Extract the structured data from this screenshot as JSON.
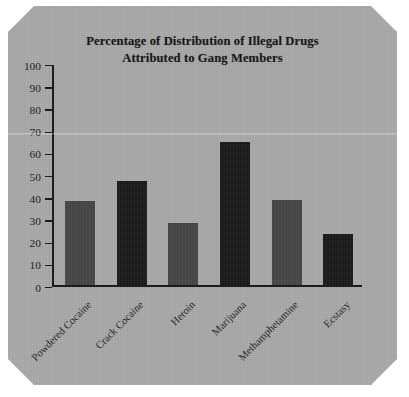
{
  "figure": {
    "background_color": "#a9a9a9",
    "title_color": "#131313"
  },
  "chart_data": {
    "type": "bar",
    "title": "Percentage of Distribution of Illegal Drugs Attributed to Gang Members",
    "title_lines": [
      "Percentage of Distribution of Illegal Drugs",
      "Attributed to Gang Members"
    ],
    "xlabel": "",
    "ylabel": "",
    "ylim": [
      0,
      100
    ],
    "ytick_step": 10,
    "yticks": [
      100,
      90,
      80,
      70,
      60,
      50,
      40,
      30,
      20,
      10,
      0
    ],
    "ytick_labels": [
      "100",
      "90",
      "80",
      "70",
      "60",
      "50",
      "40",
      "30",
      "20",
      "10",
      "0"
    ],
    "grid": false,
    "legend": false,
    "xtick_rotation": -45,
    "categories": [
      "Powdered Cocaine",
      "Crack Cocaine",
      "Heroin",
      "Marijuana",
      "Methamphetamine",
      "Ecstasy"
    ],
    "values": [
      38,
      47,
      28,
      64.5,
      38.5,
      23
    ],
    "bar_colors": [
      "#454545",
      "#191919",
      "#454545",
      "#191919",
      "#454545",
      "#191919"
    ]
  }
}
